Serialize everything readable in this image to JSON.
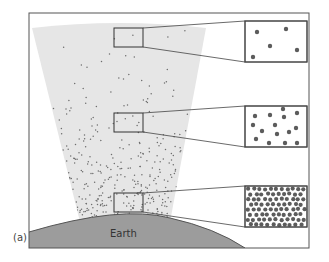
{
  "figure": {
    "panel_label": "(a)",
    "earth_label": "Earth",
    "colors": {
      "frame": "#555555",
      "atmosphere": "#e6e6e6",
      "particle": "#6a6a6a",
      "earth": "#9a9a9a",
      "earth_edge": "#555555"
    },
    "samples": [
      {
        "name": "high-altitude",
        "density": "sparse",
        "magnified_particle_count": 4
      },
      {
        "name": "mid-altitude",
        "density": "medium",
        "magnified_particle_count": 15
      },
      {
        "name": "low-altitude",
        "density": "dense",
        "magnified_particle_count": 80
      }
    ]
  }
}
